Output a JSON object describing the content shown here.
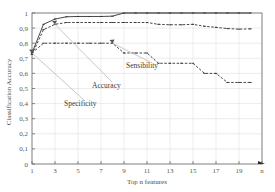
{
  "chart_data": {
    "type": "line",
    "title": "",
    "xlabel": "Top n features",
    "ylabel": "Classification Accuracy",
    "xlim": [
      1,
      21
    ],
    "ylim": [
      0,
      1
    ],
    "grid": true,
    "legend_position": "inline-annotations",
    "x_tick_labels": [
      "1",
      "3",
      "5",
      "7",
      "9",
      "11",
      "13",
      "15",
      "17",
      "19",
      "n"
    ],
    "x_tick_values": [
      1,
      3,
      5,
      7,
      9,
      11,
      13,
      15,
      17,
      19,
      21
    ],
    "y_tick_labels": [
      "0",
      "0,1",
      "0,2",
      "0,3",
      "0,4",
      "0,5",
      "0,6",
      "0,7",
      "0,8",
      "0,9",
      "1"
    ],
    "y_tick_values": [
      0,
      0.1,
      0.2,
      0.3,
      0.4,
      0.5,
      0.6,
      0.7,
      0.8,
      0.9,
      1
    ],
    "x": [
      1,
      2,
      3,
      4,
      5,
      6,
      7,
      8,
      9,
      10,
      11,
      12,
      13,
      14,
      15,
      16,
      17,
      18,
      19,
      20
    ],
    "series": [
      {
        "name": "Specificity",
        "style": "solid",
        "values": [
          0.735,
          0.925,
          0.96,
          0.975,
          0.977,
          0.977,
          0.977,
          0.979,
          1.0,
          1.0,
          1.0,
          1.0,
          1.0,
          1.0,
          1.0,
          1.0,
          1.0,
          1.0,
          1.0,
          1.0
        ]
      },
      {
        "name": "Accuracy",
        "style": "dashed",
        "values": [
          0.725,
          0.89,
          0.925,
          0.937,
          0.937,
          0.937,
          0.937,
          0.937,
          0.937,
          0.937,
          0.937,
          0.925,
          0.922,
          0.922,
          0.925,
          0.912,
          0.905,
          0.897,
          0.893,
          0.895
        ]
      },
      {
        "name": "Sensibility",
        "style": "dashed",
        "values": [
          0.735,
          0.8,
          0.8,
          0.8,
          0.8,
          0.8,
          0.8,
          0.8,
          0.735,
          0.735,
          0.735,
          0.667,
          0.667,
          0.667,
          0.667,
          0.6,
          0.6,
          0.54,
          0.54,
          0.54
        ]
      }
    ],
    "annotations": [
      {
        "label": "Sensibility",
        "target_x": 8,
        "target_y": 0.8
      },
      {
        "label": "Accuracy",
        "target_x": 3,
        "target_y": 0.925
      },
      {
        "label": "Specificity",
        "target_x": 1,
        "target_y": 0.735
      }
    ]
  }
}
